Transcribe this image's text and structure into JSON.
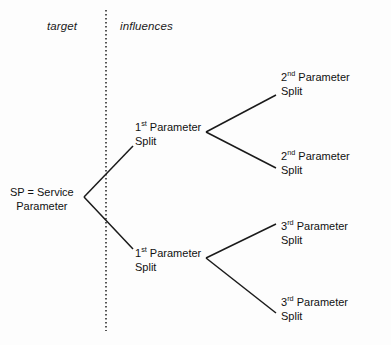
{
  "diagram": {
    "background_color": "#fdfdfd",
    "line_color": "#1a1a1a",
    "text_color": "#111111",
    "headers": {
      "target": "target",
      "influences": "influences"
    },
    "divider": {
      "style": "dotted",
      "orientation": "vertical",
      "x": 106,
      "y_start": 10,
      "y_end": 331
    },
    "nodes": {
      "root": {
        "line1": "SP = Service",
        "line2": "Parameter"
      },
      "level1_upper": {
        "ordinal": "1",
        "ordinal_suffix": "st",
        "word": " Parameter",
        "line2": "Split"
      },
      "level1_lower": {
        "ordinal": "1",
        "ordinal_suffix": "st",
        "word": " Parameter",
        "line2": "Split"
      },
      "level2_a": {
        "ordinal": "2",
        "ordinal_suffix": "nd",
        "word": " Parameter",
        "line2": "Split"
      },
      "level2_b": {
        "ordinal": "2",
        "ordinal_suffix": "nd",
        "word": " Parameter",
        "line2": "Split"
      },
      "level2_c": {
        "ordinal": "3",
        "ordinal_suffix": "rd",
        "word": " Parameter",
        "line2": "Split"
      },
      "level2_d": {
        "ordinal": "3",
        "ordinal_suffix": "rd",
        "word": " Parameter",
        "line2": "Split"
      }
    }
  }
}
